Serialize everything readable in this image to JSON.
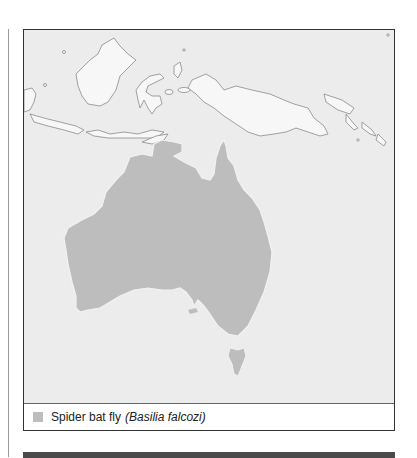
{
  "map": {
    "region": "Australia and Southeast Asia",
    "fill_color": "#bdbdbd",
    "background_color": "#ececec",
    "outline_color": "#888888"
  },
  "legend": {
    "items": [
      {
        "swatch_color": "#bdbdbd",
        "common_name": "Spider bat fly",
        "scientific_name": "(Basilia falcozi)"
      }
    ]
  }
}
